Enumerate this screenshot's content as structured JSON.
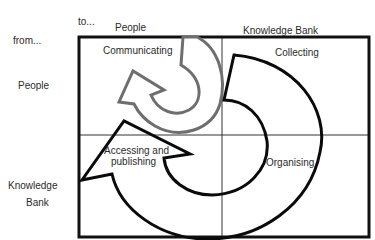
{
  "diagram": {
    "axes": {
      "to_label": "to...",
      "from_label": "from...",
      "columns": [
        "People",
        "Knowledge Bank"
      ],
      "rows": [
        "People",
        "Knowledge Bank"
      ],
      "row_knowledge_bank_line1": "Knowledge",
      "row_knowledge_bank_line2": "Bank"
    },
    "quadrants": {
      "people_to_people": "Communicating",
      "people_to_kb": "Collecting",
      "kb_to_people_line1": "Accessing and",
      "kb_to_people_line2": "publishing",
      "kb_to_kb": "Organising"
    },
    "arrows": [
      {
        "name": "communicating-cycle",
        "color": "#6e6e6e",
        "direction": "clockwise, within People-to-People quadrant"
      },
      {
        "name": "knowledge-cycle",
        "color": "#000000",
        "direction": "clockwise: Collecting → Organising → Accessing and publishing"
      }
    ],
    "colors": {
      "frame": "#111111",
      "divider": "#333333",
      "gray_arrow": "#6e6e6e",
      "black_arrow": "#0a0a0a"
    }
  }
}
